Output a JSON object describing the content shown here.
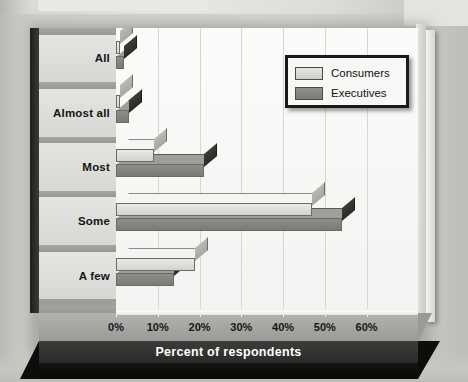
{
  "chart_data": {
    "type": "bar",
    "orientation": "horizontal",
    "title": "",
    "xlabel": "Percent of respondents",
    "ylabel": "",
    "categories": [
      "All",
      "Almost all",
      "Most",
      "Some",
      "A few"
    ],
    "series": [
      {
        "name": "Consumers",
        "values": [
          1,
          1,
          9,
          47,
          19
        ],
        "color": "#dcdcd9"
      },
      {
        "name": "Executives",
        "values": [
          2,
          3,
          21,
          54,
          14
        ],
        "color": "#828280"
      }
    ],
    "xlim": [
      0,
      60
    ],
    "xticks": [
      0,
      10,
      20,
      30,
      40,
      50,
      60
    ],
    "xticklabels": [
      "0%",
      "10%",
      "20%",
      "30%",
      "40%",
      "50%",
      "60%"
    ],
    "grid": true,
    "legend_position": "top-right",
    "style": "3d-bar"
  },
  "legend": {
    "entries": [
      {
        "label": "Consumers",
        "swatch": "legend-swatch-consumers"
      },
      {
        "label": "Executives",
        "swatch": "legend-swatch-executives"
      }
    ]
  },
  "axis": {
    "x_title": "Percent of respondents"
  },
  "colors": {
    "consumers": "#dcdcd9",
    "executives": "#828280",
    "plot_background": "#f7f7f5",
    "gridline": "#d6d6d3",
    "base_slab": "#2a2a28",
    "axis_title_text": "#ffffff",
    "label_text": "#141414"
  }
}
